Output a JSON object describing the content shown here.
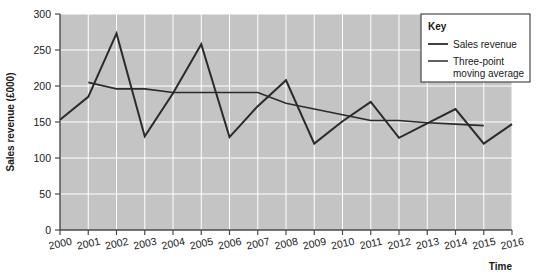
{
  "chart_data": {
    "type": "line",
    "title": "",
    "xlabel": "Time",
    "ylabel": "Sales revenue (£000)",
    "xlim": [
      2000,
      2016
    ],
    "ylim": [
      0,
      300
    ],
    "yticks": [
      0,
      50,
      100,
      150,
      200,
      250,
      300
    ],
    "ytick_labels": [
      "0",
      "50",
      "100",
      "150",
      "200",
      "250",
      "300"
    ],
    "categories": [
      2000,
      2001,
      2002,
      2003,
      2004,
      2005,
      2006,
      2007,
      2008,
      2009,
      2010,
      2011,
      2012,
      2013,
      2014,
      2015,
      2016
    ],
    "xtick_labels": [
      "2000",
      "2001",
      "2002",
      "2003",
      "2004",
      "2005",
      "2006",
      "2007",
      "2008",
      "2009",
      "2010",
      "2011",
      "2012",
      "2013",
      "2014",
      "2015",
      "2016"
    ],
    "grid": true,
    "grid_color": "#ffffff",
    "plot_background": "#c4c4c4",
    "line_color": "#2b2b2b",
    "legend_position": "top-right",
    "series": [
      {
        "name": "Sales revenue",
        "x": [
          2000,
          2001,
          2002,
          2003,
          2004,
          2005,
          2006,
          2007,
          2008,
          2009,
          2010,
          2011,
          2012,
          2013,
          2014,
          2015,
          2016
        ],
        "values": [
          153,
          185,
          273,
          130,
          190,
          258,
          129,
          172,
          208,
          120,
          151,
          178,
          128,
          148,
          168,
          120,
          147
        ]
      },
      {
        "name": "Three-point moving average",
        "x": [
          2001,
          2002,
          2003,
          2004,
          2005,
          2006,
          2007,
          2008,
          2009,
          2010,
          2011,
          2012,
          2013,
          2014,
          2015
        ],
        "values": [
          205,
          196,
          196,
          191,
          191,
          191,
          191,
          176,
          168,
          160,
          152,
          152,
          149,
          147,
          145
        ]
      }
    ]
  },
  "legend": {
    "title": "Key",
    "entries": [
      {
        "label": "Sales revenue",
        "label_line2": ""
      },
      {
        "label": "Three-point",
        "label_line2": "moving average"
      }
    ]
  }
}
